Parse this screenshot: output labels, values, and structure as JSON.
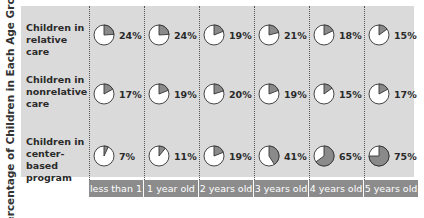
{
  "y_axis_label": "Percentage of Children in Each Age Group*",
  "rows": [
    {
      "label_lines": [
        "Children in",
        "relative care"
      ],
      "values": [
        24,
        24,
        19,
        21,
        18,
        15
      ]
    },
    {
      "label_lines": [
        "Children in",
        "nonrelative",
        "care"
      ],
      "values": [
        17,
        19,
        20,
        19,
        15,
        17
      ]
    },
    {
      "label_lines": [
        "Children in",
        "center-based",
        "program"
      ],
      "values": [
        7,
        11,
        19,
        41,
        65,
        75
      ]
    }
  ],
  "columns": [
    "less than 1",
    "1 year old",
    "2 years old",
    "3 years old",
    "4 years old",
    "5 years old"
  ],
  "colors": {
    "panel": "#dadada",
    "pie_fill": "#8a8a8a",
    "pie_bg": "#ffffff",
    "axis_bar": "#8c8c8c"
  },
  "chart_data": {
    "type": "pie",
    "title": "",
    "ylabel": "Percentage of Children in Each Age Group*",
    "categories": [
      "less than 1",
      "1 year old",
      "2 years old",
      "3 years old",
      "4 years old",
      "5 years old"
    ],
    "series": [
      {
        "name": "Children in relative care",
        "values": [
          24,
          24,
          19,
          21,
          18,
          15
        ]
      },
      {
        "name": "Children in nonrelative care",
        "values": [
          17,
          19,
          20,
          19,
          15,
          17
        ]
      },
      {
        "name": "Children in center-based program",
        "values": [
          7,
          11,
          19,
          41,
          65,
          75
        ]
      }
    ],
    "unit": "%"
  }
}
